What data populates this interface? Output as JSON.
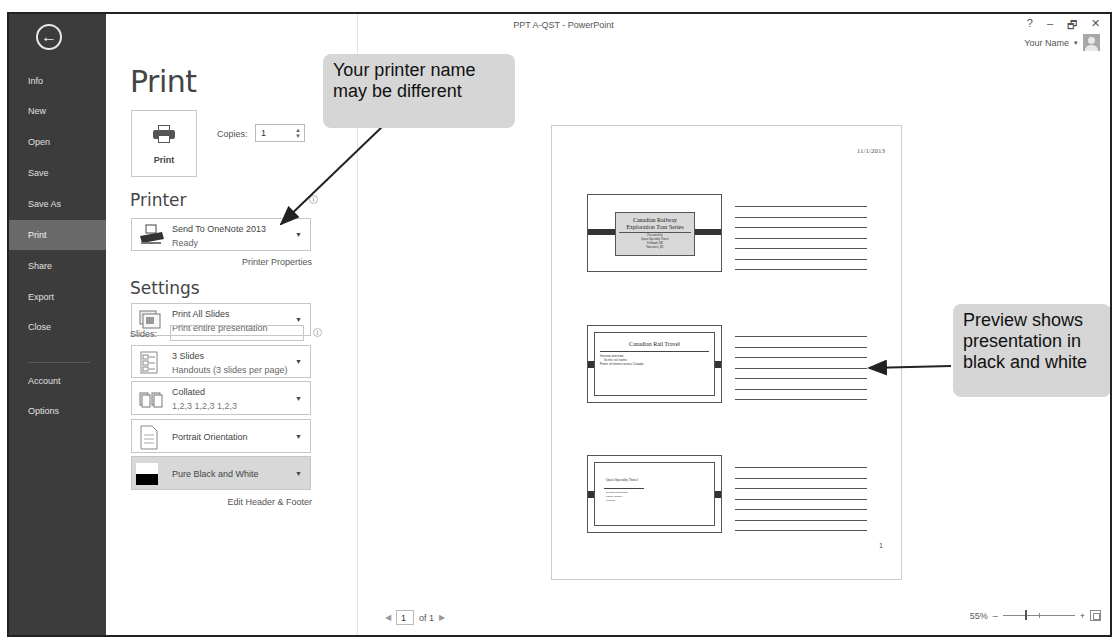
{
  "window": {
    "title": "PPT A-QST - PowerPoint",
    "controls": {
      "help": "?",
      "minimize": "–",
      "restore": "🗗",
      "close": "✕"
    },
    "user_name": "Your Name",
    "user_caret": "▾"
  },
  "sidebar": {
    "back_glyph": "←",
    "items": [
      {
        "label": "Info"
      },
      {
        "label": "New"
      },
      {
        "label": "Open"
      },
      {
        "label": "Save"
      },
      {
        "label": "Save As"
      },
      {
        "label": "Print",
        "active": true
      },
      {
        "label": "Share"
      },
      {
        "label": "Export"
      },
      {
        "label": "Close"
      },
      {
        "label": "Account"
      },
      {
        "label": "Options"
      }
    ]
  },
  "print_panel": {
    "title": "Print",
    "print_button_label": "Print",
    "copies_label": "Copies:",
    "copies_value": "1",
    "printer_heading": "Printer",
    "printer": {
      "name": "Send To OneNote 2013",
      "status": "Ready"
    },
    "printer_properties_link": "Printer Properties",
    "settings_heading": "Settings",
    "settings": {
      "range": {
        "title": "Print All Slides",
        "subtitle": "Print entire presentation"
      },
      "slides_label": "Slides:",
      "slides_value": "",
      "layout": {
        "title": "3 Slides",
        "subtitle": "Handouts (3 slides per page)"
      },
      "collation": {
        "title": "Collated",
        "subtitle": "1,2,3   1,2,3   1,2,3"
      },
      "orientation": {
        "title": "Portrait Orientation"
      },
      "color": {
        "title": "Pure Black and White"
      }
    },
    "edit_header_footer_link": "Edit Header & Footer",
    "dropdown_arrow": "▼",
    "info_glyph": "i"
  },
  "preview": {
    "date": "11/1/2013",
    "page_number": "1",
    "slides": [
      {
        "title_line1": "Canadian Railway",
        "title_line2": "Exploration Tour Series",
        "sub_lines": [
          "Presented by",
          "Quest Specialty Travel",
          "Portland, OR",
          "Vancouver, BC"
        ]
      },
      {
        "title": "Canadian Rail Travel",
        "bullets": [
          "Itinerary overview",
          "Scenic rail routes",
          "Points of interest across Canada"
        ]
      },
      {
        "title": "Quest Specialty Travel",
        "bullets": [
          "Contact information",
          "Phone number",
          "Website"
        ]
      }
    ],
    "note_lines_per_slide": 7
  },
  "status_bar": {
    "prev_page": "◀",
    "current_page": "1",
    "page_of": "of 1",
    "next_page": "▶",
    "zoom_level": "55%",
    "zoom_out": "–",
    "zoom_in": "+"
  },
  "callouts": {
    "printer_note": [
      "Your printer name",
      "may be different"
    ],
    "preview_note": [
      "Preview shows",
      "presentation in",
      "black and white"
    ]
  }
}
